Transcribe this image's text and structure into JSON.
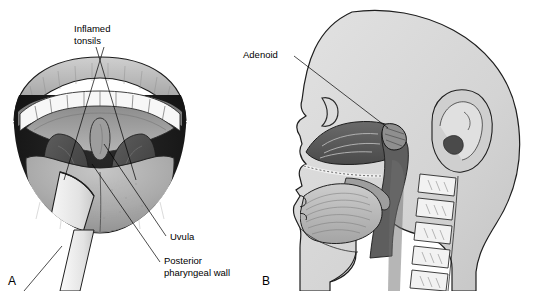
{
  "figure": {
    "type": "medical-illustration",
    "background_color": "#ffffff",
    "line_color": "#000000"
  },
  "panel_a": {
    "letter": "A",
    "view": "open-mouth-anterior-view-with-tongue-depressor",
    "labels": {
      "inflamed_tonsils_line1": "Inflamed",
      "inflamed_tonsils_line2": "tonsils",
      "uvula": "Uvula",
      "posterior_wall_line1": "Posterior",
      "posterior_wall_line2": "pharyngeal wall"
    },
    "structures": [
      "upper-lip",
      "lower-lip",
      "upper-teeth",
      "lower-teeth",
      "soft-palate",
      "uvula",
      "palatine-tonsil-left",
      "palatine-tonsil-right",
      "posterior-pharyngeal-wall",
      "tongue",
      "tongue-depressor"
    ],
    "colors": {
      "lip": "#b8b8b8",
      "teeth": "#f4f4f4",
      "soft_palate": "#9a9a9a",
      "tonsil": "#4f4f4f",
      "pharynx": "#1c1c1c",
      "tongue": "#a9a9a9",
      "depressor": "#ededed"
    }
  },
  "panel_b": {
    "letter": "B",
    "view": "sagittal-section-of-head",
    "labels": {
      "adenoid": "Adenoid"
    },
    "structures": [
      "head-outline",
      "frontal-sinus",
      "nasal-cavity",
      "turbinates",
      "hard-palate",
      "soft-palate",
      "tongue",
      "adenoid",
      "nasopharynx",
      "oropharynx",
      "ear-auricle",
      "cervical-vertebrae",
      "mandible",
      "neck"
    ],
    "colors": {
      "skin": "#d8d8d8",
      "airway": "#636363",
      "nasal_mucosa": "#5a5a5a",
      "tongue": "#c0c0c0",
      "vertebra": "#f0f0f0",
      "ear": "#cfcfcf"
    }
  }
}
